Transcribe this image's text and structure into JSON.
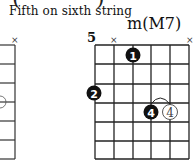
{
  "header": {
    "open_paren": "(",
    "close_paren": ")",
    "subtitle": "Fifth on sixth string"
  },
  "chord": {
    "name": "m(M7)",
    "start_fret": "5",
    "muted_marks": [
      "×",
      "×"
    ],
    "left_partial_mute": "×",
    "fingers": [
      {
        "label": "1",
        "string": 3,
        "fret": 1,
        "style": "filled"
      },
      {
        "label": "2",
        "string": 6,
        "fret": 3,
        "style": "filled"
      },
      {
        "label": "4",
        "string": 4,
        "fret": 4,
        "style": "filled"
      },
      {
        "label": "4",
        "string": 5,
        "fret": 4,
        "style": "outline"
      }
    ]
  },
  "colors": {
    "ink": "#111111",
    "background": "#ffffff"
  }
}
